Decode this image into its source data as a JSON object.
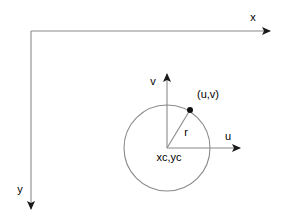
{
  "figure": {
    "background_color": "#ffffff",
    "line_color": "#6f6f6f",
    "dark_line_color": "#3a3a3a",
    "text_color": "#000000"
  },
  "image_axes": {
    "name": "image-coordinate-axes",
    "origin": {
      "x": 31,
      "y": 31
    },
    "x_axis": {
      "label": "x",
      "label_x": 253,
      "label_y": 18,
      "from": {
        "x": 31,
        "y": 31
      },
      "to": {
        "x": 270,
        "y": 31
      },
      "direction": "right"
    },
    "y_axis": {
      "label": "y",
      "label_x": 20,
      "label_y": 190,
      "from": {
        "x": 31,
        "y": 31
      },
      "to": {
        "x": 31,
        "y": 209
      },
      "direction": "down"
    }
  },
  "local_axes": {
    "name": "circle-local-axes",
    "origin": {
      "x": 167,
      "y": 148
    },
    "u_axis": {
      "label": "u",
      "label_x": 228,
      "label_y": 137,
      "from": {
        "x": 167,
        "y": 148
      },
      "to": {
        "x": 240,
        "y": 148
      },
      "direction": "right"
    },
    "v_axis": {
      "label": "v",
      "label_x": 153,
      "label_y": 82,
      "from": {
        "x": 167,
        "y": 148
      },
      "to": {
        "x": 167,
        "y": 74
      },
      "direction": "up"
    }
  },
  "circle": {
    "name": "circle-shape",
    "center": {
      "x": 167,
      "y": 148
    },
    "radius": 43,
    "center_label": "xc,yc",
    "center_label_x": 169,
    "center_label_y": 158
  },
  "radius_line": {
    "name": "radius-line",
    "label": "r",
    "label_x": 186,
    "label_y": 133,
    "from": {
      "x": 167,
      "y": 148
    },
    "to": {
      "x": 190,
      "y": 110
    }
  },
  "point": {
    "name": "point-on-circle",
    "label": "(u,v)",
    "label_x": 197,
    "label_y": 95,
    "x": 190,
    "y": 110,
    "dot_radius": 3
  }
}
